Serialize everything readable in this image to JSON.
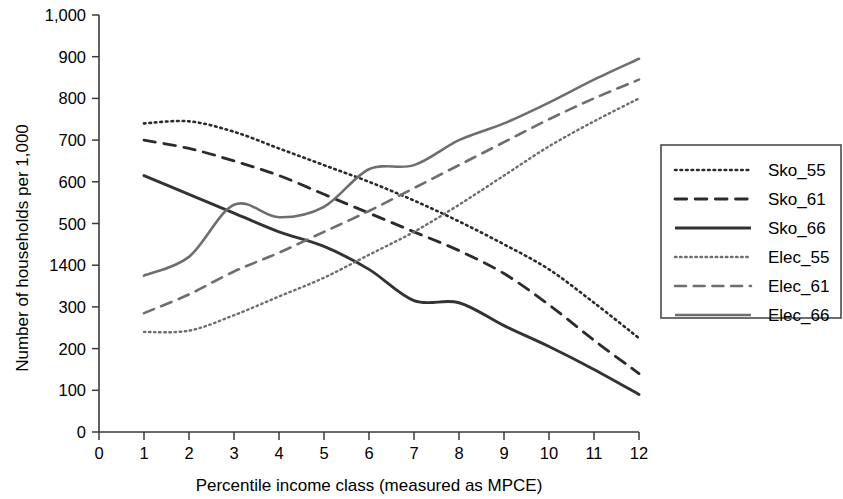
{
  "chart_data": {
    "type": "line",
    "title": "",
    "xlabel": "Percentile income class (measured as MPCE)",
    "ylabel": "Number of households per 1,000",
    "xlim": [
      0,
      12
    ],
    "ylim": [
      0,
      1000
    ],
    "xticks": [
      "0",
      "1",
      "2",
      "3",
      "4",
      "5",
      "6",
      "7",
      "8",
      "9",
      "10",
      "11",
      "12"
    ],
    "yticks": [
      "0",
      "100",
      "200",
      "300",
      "1400",
      "500",
      "600",
      "700",
      "800",
      "900",
      "1,000"
    ],
    "ytick_values": [
      0,
      100,
      200,
      300,
      400,
      500,
      600,
      700,
      800,
      900,
      1000
    ],
    "grid": false,
    "legend_position": "right-outside",
    "x": [
      1,
      2,
      3,
      4,
      5,
      6,
      7,
      8,
      9,
      10,
      11,
      12
    ],
    "series": [
      {
        "name": "Sko_55",
        "style": "dotted",
        "color": "#2b2b2b",
        "width": 2.6,
        "values": [
          740,
          745,
          720,
          680,
          640,
          600,
          555,
          505,
          450,
          390,
          310,
          225
        ]
      },
      {
        "name": "Sko_61",
        "style": "dashed",
        "color": "#2b2b2b",
        "width": 2.8,
        "values": [
          700,
          680,
          650,
          615,
          570,
          525,
          480,
          435,
          380,
          305,
          220,
          140
        ]
      },
      {
        "name": "Sko_66",
        "style": "solid",
        "color": "#333333",
        "width": 2.9,
        "values": [
          615,
          570,
          525,
          480,
          445,
          390,
          315,
          310,
          255,
          205,
          150,
          90
        ]
      },
      {
        "name": "Elec_55",
        "style": "dotted",
        "color": "#6e6e6e",
        "width": 2.4,
        "values": [
          240,
          243,
          280,
          325,
          370,
          425,
          480,
          545,
          615,
          685,
          745,
          800
        ]
      },
      {
        "name": "Elec_61",
        "style": "dashed",
        "color": "#6e6e6e",
        "width": 2.6,
        "values": [
          285,
          330,
          385,
          430,
          480,
          530,
          585,
          640,
          695,
          750,
          800,
          845
        ]
      },
      {
        "name": "Elec_66",
        "style": "solid",
        "color": "#6e6e6e",
        "width": 2.6,
        "values": [
          375,
          420,
          545,
          515,
          540,
          630,
          640,
          700,
          740,
          790,
          845,
          895
        ]
      }
    ]
  },
  "legend": {
    "items": [
      {
        "label": "Sko_55"
      },
      {
        "label": "Sko_61"
      },
      {
        "label": "Sko_66"
      },
      {
        "label": "Elec_55"
      },
      {
        "label": "Elec_61"
      },
      {
        "label": "Elec_66"
      }
    ]
  }
}
